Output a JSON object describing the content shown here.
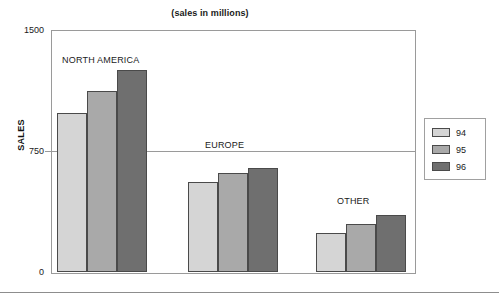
{
  "chart_data": {
    "type": "bar",
    "title": "(sales in millions)",
    "xlabel": "",
    "ylabel": "SALES",
    "ylim": [
      0,
      1500
    ],
    "yticks": [
      0,
      750,
      1500
    ],
    "ytick_labels": [
      "0",
      "750",
      "1500"
    ],
    "grid": true,
    "grid_axis": "y",
    "legend_position": "right",
    "categories": [
      "NORTH AMERICA",
      "EUROPE",
      "OTHER"
    ],
    "series": [
      {
        "name": "94",
        "color": "#d5d5d5",
        "values": [
          985,
          560,
          240
        ]
      },
      {
        "name": "95",
        "color": "#a9a9a9",
        "values": [
          1120,
          615,
          300
        ]
      },
      {
        "name": "96",
        "color": "#6f6f6f",
        "values": [
          1250,
          645,
          355
        ]
      }
    ],
    "annotations": [
      {
        "text": "NORTH AMERICA",
        "group": "NORTH AMERICA"
      },
      {
        "text": "EUROPE",
        "group": "EUROPE"
      },
      {
        "text": "OTHER",
        "group": "OTHER"
      }
    ]
  },
  "legend": {
    "entries": [
      {
        "label": "94",
        "color": "#d5d5d5"
      },
      {
        "label": "95",
        "color": "#a9a9a9"
      },
      {
        "label": "96",
        "color": "#6f6f6f"
      }
    ]
  },
  "axis": {
    "y_title": "SALES",
    "y_tick_top": "1500",
    "y_tick_mid": "750",
    "y_tick_bottom": "0"
  },
  "groups": [
    {
      "label": "NORTH AMERICA",
      "label_left": 62,
      "label_top": 55,
      "bars_left": 57
    },
    {
      "label": "EUROPE",
      "label_left": 205,
      "label_top": 140,
      "bars_left": 188
    },
    {
      "label": "OTHER",
      "label_left": 337,
      "label_top": 196,
      "bars_left": 316
    }
  ],
  "layout": {
    "plot_left": 51,
    "plot_top": 30,
    "plot_width": 363,
    "plot_height": 242,
    "bar_width": 30,
    "bar_gap": 0
  }
}
